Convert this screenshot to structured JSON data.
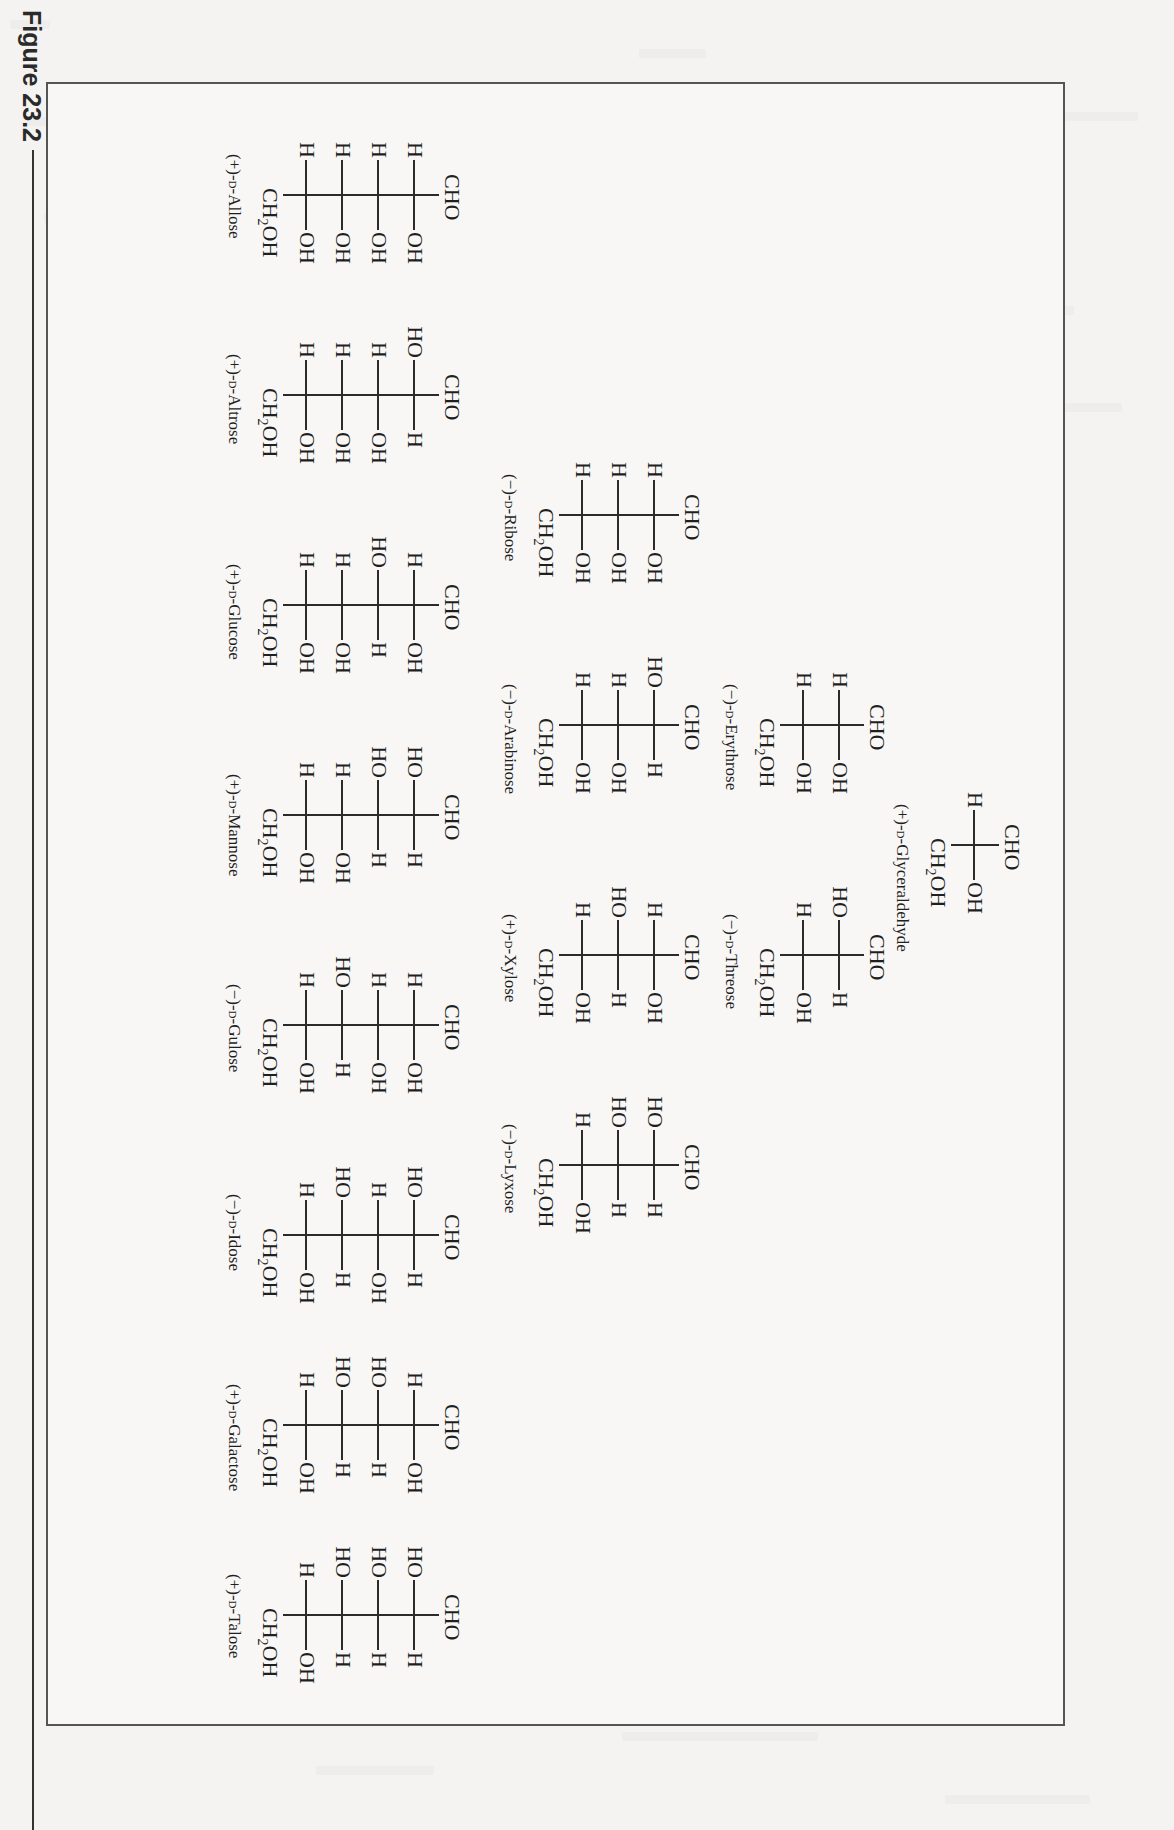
{
  "figure": {
    "caption": "Figure 23.2",
    "orientation": "rotated-90",
    "title_hint": "D-aldose family tree (Fischer projections)"
  },
  "tiers": [
    {
      "tier": "triose",
      "sugars": [
        {
          "name": "(+)-D-Glyceraldehyde",
          "sign": "(+)-",
          "config": "D",
          "base": "Glyceraldehyde",
          "top": "CHO",
          "bottom": "CH2OH",
          "rows": [
            {
              "left": "H",
              "right": "OH"
            }
          ]
        }
      ]
    },
    {
      "tier": "tetroses",
      "sugars": [
        {
          "name": "(−)-D-Erythrose",
          "sign": "(−)-",
          "config": "D",
          "base": "Erythrose",
          "top": "CHO",
          "bottom": "CH2OH",
          "rows": [
            {
              "left": "H",
              "right": "OH"
            },
            {
              "left": "H",
              "right": "OH"
            }
          ]
        },
        {
          "name": "(−)-D-Threose",
          "sign": "(−)-",
          "config": "D",
          "base": "Threose",
          "top": "CHO",
          "bottom": "CH2OH",
          "rows": [
            {
              "left": "HO",
              "right": "H"
            },
            {
              "left": "H",
              "right": "OH"
            }
          ]
        }
      ]
    },
    {
      "tier": "pentoses",
      "sugars": [
        {
          "name": "(−)-D-Ribose",
          "sign": "(−)-",
          "config": "D",
          "base": "Ribose",
          "top": "CHO",
          "bottom": "CH2OH",
          "rows": [
            {
              "left": "H",
              "right": "OH"
            },
            {
              "left": "H",
              "right": "OH"
            },
            {
              "left": "H",
              "right": "OH"
            }
          ]
        },
        {
          "name": "(−)-D-Arabinose",
          "sign": "(−)-",
          "config": "D",
          "base": "Arabinose",
          "top": "CHO",
          "bottom": "CH2OH",
          "rows": [
            {
              "left": "HO",
              "right": "H"
            },
            {
              "left": "H",
              "right": "OH"
            },
            {
              "left": "H",
              "right": "OH"
            }
          ]
        },
        {
          "name": "(+)-D-Xylose",
          "sign": "(+)-",
          "config": "D",
          "base": "Xylose",
          "top": "CHO",
          "bottom": "CH2OH",
          "rows": [
            {
              "left": "H",
              "right": "OH"
            },
            {
              "left": "HO",
              "right": "H"
            },
            {
              "left": "H",
              "right": "OH"
            }
          ]
        },
        {
          "name": "(−)-D-Lyxose",
          "sign": "(−)-",
          "config": "D",
          "base": "Lyxose",
          "top": "CHO",
          "bottom": "CH2OH",
          "rows": [
            {
              "left": "HO",
              "right": "H"
            },
            {
              "left": "HO",
              "right": "H"
            },
            {
              "left": "H",
              "right": "OH"
            }
          ]
        }
      ]
    },
    {
      "tier": "hexoses",
      "sugars": [
        {
          "name": "(+)-D-Allose",
          "sign": "(+)-",
          "config": "D",
          "base": "Allose",
          "top": "CHO",
          "bottom": "CH2OH",
          "rows": [
            {
              "left": "H",
              "right": "OH"
            },
            {
              "left": "H",
              "right": "OH"
            },
            {
              "left": "H",
              "right": "OH"
            },
            {
              "left": "H",
              "right": "OH"
            }
          ]
        },
        {
          "name": "(+)-D-Altrose",
          "sign": "(+)-",
          "config": "D",
          "base": "Altrose",
          "top": "CHO",
          "bottom": "CH2OH",
          "rows": [
            {
              "left": "HO",
              "right": "H"
            },
            {
              "left": "H",
              "right": "OH"
            },
            {
              "left": "H",
              "right": "OH"
            },
            {
              "left": "H",
              "right": "OH"
            }
          ]
        },
        {
          "name": "(+)-D-Glucose",
          "sign": "(+)-",
          "config": "D",
          "base": "Glucose",
          "top": "CHO",
          "bottom": "CH2OH",
          "rows": [
            {
              "left": "H",
              "right": "OH"
            },
            {
              "left": "HO",
              "right": "H"
            },
            {
              "left": "H",
              "right": "OH"
            },
            {
              "left": "H",
              "right": "OH"
            }
          ]
        },
        {
          "name": "(+)-D-Mannose",
          "sign": "(+)-",
          "config": "D",
          "base": "Mannose",
          "top": "CHO",
          "bottom": "CH2OH",
          "rows": [
            {
              "left": "HO",
              "right": "H"
            },
            {
              "left": "HO",
              "right": "H"
            },
            {
              "left": "H",
              "right": "OH"
            },
            {
              "left": "H",
              "right": "OH"
            }
          ]
        },
        {
          "name": "(−)-D-Gulose",
          "sign": "(−)-",
          "config": "D",
          "base": "Gulose",
          "top": "CHO",
          "bottom": "CH2OH",
          "rows": [
            {
              "left": "H",
              "right": "OH"
            },
            {
              "left": "H",
              "right": "OH"
            },
            {
              "left": "HO",
              "right": "H"
            },
            {
              "left": "H",
              "right": "OH"
            }
          ]
        },
        {
          "name": "(−)-D-Idose",
          "sign": "(−)-",
          "config": "D",
          "base": "Idose",
          "top": "CHO",
          "bottom": "CH2OH",
          "rows": [
            {
              "left": "HO",
              "right": "H"
            },
            {
              "left": "H",
              "right": "OH"
            },
            {
              "left": "HO",
              "right": "H"
            },
            {
              "left": "H",
              "right": "OH"
            }
          ]
        },
        {
          "name": "(+)-D-Galactose",
          "sign": "(+)-",
          "config": "D",
          "base": "Galactose",
          "top": "CHO",
          "bottom": "CH2OH",
          "rows": [
            {
              "left": "H",
              "right": "OH"
            },
            {
              "left": "HO",
              "right": "H"
            },
            {
              "left": "HO",
              "right": "H"
            },
            {
              "left": "H",
              "right": "OH"
            }
          ]
        },
        {
          "name": "(+)-D-Talose",
          "sign": "(+)-",
          "config": "D",
          "base": "Talose",
          "top": "CHO",
          "bottom": "CH2OH",
          "rows": [
            {
              "left": "HO",
              "right": "H"
            },
            {
              "left": "HO",
              "right": "H"
            },
            {
              "left": "HO",
              "right": "H"
            },
            {
              "left": "H",
              "right": "OH"
            }
          ]
        }
      ]
    }
  ],
  "colors": {
    "page": "#f4f3f1",
    "ink": "#1f1f1f",
    "frame": "#555555"
  }
}
